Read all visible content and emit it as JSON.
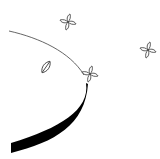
{
  "illustration": {
    "subject": "table edge with scattered flowers and a leaf",
    "colors": {
      "background": "#ffffff",
      "stroke": "#000000",
      "band_fill": "#000000",
      "line": "#555555"
    },
    "elements": [
      {
        "name": "flower",
        "x": 68,
        "y": 22
      },
      {
        "name": "flower",
        "x": 90,
        "y": 74
      },
      {
        "name": "flower",
        "x": 148,
        "y": 50
      },
      {
        "name": "leaf",
        "x": 46,
        "y": 67
      }
    ]
  }
}
